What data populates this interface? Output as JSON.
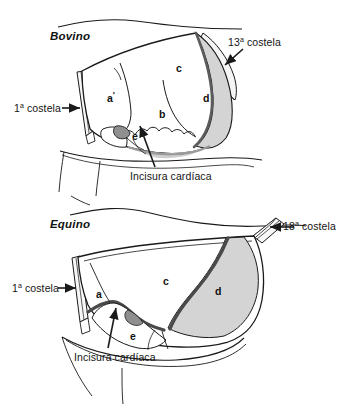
{
  "figure": {
    "title_bovino": "Bovino",
    "title_equino": "Equino",
    "background_color": "#ffffff",
    "line_color": "#1a1a1a",
    "shade_color": "#d4d4d4",
    "shade_dark_color": "#8f8f8f"
  },
  "panels": [
    {
      "id": "bovino",
      "heading": "Bovino",
      "callouts": [
        {
          "name": "rib-1",
          "text_prefix": "1",
          "text_ordinal": "a",
          "text_suffix": " costela",
          "full": "1ª costela",
          "arrow": "right"
        },
        {
          "name": "rib-13",
          "text_prefix": "13",
          "text_ordinal": "a",
          "text_suffix": " costela",
          "full": "13ª costela",
          "arrow": "down-left"
        },
        {
          "name": "incisura-cardiaca",
          "full": "Incisura cardíaca",
          "arrow": "up"
        }
      ],
      "regions": [
        {
          "name": "region-a-prime",
          "label": "a",
          "prime": "'"
        },
        {
          "name": "region-b",
          "label": "b",
          "prime": ""
        },
        {
          "name": "region-c",
          "label": "c",
          "prime": ""
        },
        {
          "name": "region-d",
          "label": "d",
          "prime": ""
        },
        {
          "name": "region-e",
          "label": "e",
          "prime": ""
        }
      ]
    },
    {
      "id": "equino",
      "heading": "Equino",
      "callouts": [
        {
          "name": "rib-1",
          "text_prefix": "1",
          "text_ordinal": "a",
          "text_suffix": " costela",
          "full": "1ª costela",
          "arrow": "right"
        },
        {
          "name": "rib-18",
          "text_prefix": "18",
          "text_ordinal": "a",
          "text_suffix": " costela",
          "full": "18ª costela",
          "arrow": "left"
        },
        {
          "name": "incisura-cardiaca",
          "full": "Incisura cardíaca",
          "arrow": "up"
        }
      ],
      "regions": [
        {
          "name": "region-a",
          "label": "a",
          "prime": ""
        },
        {
          "name": "region-c",
          "label": "c",
          "prime": ""
        },
        {
          "name": "region-d",
          "label": "d",
          "prime": ""
        },
        {
          "name": "region-e",
          "label": "e",
          "prime": ""
        }
      ]
    }
  ],
  "labels": {
    "rib1_bovino": "1ª costela",
    "rib13_bovino": "13ª costela",
    "incisura_bovino": "Incisura cardíaca",
    "rib1_equino": "1ª costela",
    "rib18_equino": "18ª costela",
    "incisura_equino": "Incisura cardíaca",
    "rib1_num": "1",
    "rib13_num": "13",
    "rib18_num": "18",
    "ordinal_mark": "a",
    "costela_word": " costela"
  }
}
